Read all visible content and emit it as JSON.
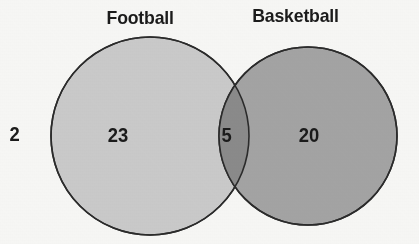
{
  "diagram": {
    "type": "venn",
    "background_color": "#f6f6f4",
    "stroke_color": "#2b2b2b",
    "sets": [
      {
        "name": "football",
        "label": "Football",
        "fill_color": "#c9c9c9",
        "only_count": "23",
        "center_x": 150,
        "center_y": 136,
        "radius": 99
      },
      {
        "name": "basketball",
        "label": "Basketball",
        "fill_color": "#a3a3a3",
        "only_count": "20",
        "center_x": 308,
        "center_y": 136,
        "radius": 89
      }
    ],
    "intersection": {
      "label": "football-and-basketball",
      "count": "5",
      "fill_color": "#8a8a8a"
    },
    "outside": {
      "label": "neither",
      "count": "2"
    }
  },
  "chart_data": {
    "type": "venn",
    "title": "",
    "categories": [
      "Football only",
      "Both",
      "Basketball only",
      "Neither"
    ],
    "values": [
      23,
      5,
      20,
      2
    ],
    "sets": [
      {
        "name": "Football",
        "total": 28,
        "exclusive": 23
      },
      {
        "name": "Basketball",
        "total": 25,
        "exclusive": 20
      }
    ],
    "intersection": 5,
    "outside": 2,
    "universe_total": 50,
    "legend": [
      "Football",
      "Basketball"
    ],
    "legend_position": "top",
    "grid": false
  }
}
